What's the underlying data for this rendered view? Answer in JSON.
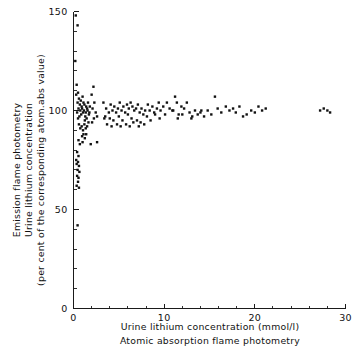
{
  "chart_data": {
    "type": "scatter",
    "title": "",
    "xlabel": "Urine lithium concentration (mmol/l)",
    "xlabel2": "Atomic absorption flame photometry",
    "ylabel": "Emission flame photometry",
    "ylabel2": "Urine lithium concentration",
    "ylabel3": "(per cent of the corresponding atom.abs value)",
    "xlim": [
      0,
      30
    ],
    "ylim": [
      0,
      150
    ],
    "xticks": [
      0,
      10,
      20,
      30
    ],
    "xticklabels": [
      "0",
      "10",
      "20",
      "30"
    ],
    "yticks": [
      0,
      50,
      100,
      150
    ],
    "yticklabels": [
      "0",
      "50",
      "100",
      "150"
    ],
    "x_minor_step": 2,
    "y_minor_step": 10,
    "grid": false,
    "legend": null,
    "marker": "filled-square",
    "marker_color": "#111111",
    "marker_size_px": 2.4,
    "points": [
      [
        0.25,
        148
      ],
      [
        0.45,
        143
      ],
      [
        0.2,
        125
      ],
      [
        0.35,
        113
      ],
      [
        0.3,
        108
      ],
      [
        0.5,
        109
      ],
      [
        0.6,
        106
      ],
      [
        0.45,
        104
      ],
      [
        0.7,
        103
      ],
      [
        0.55,
        101
      ],
      [
        0.4,
        99
      ],
      [
        0.65,
        97
      ],
      [
        0.5,
        96
      ],
      [
        0.8,
        105
      ],
      [
        0.9,
        102
      ],
      [
        0.75,
        100
      ],
      [
        0.85,
        98
      ],
      [
        1.0,
        107
      ],
      [
        1.1,
        104
      ],
      [
        0.95,
        101
      ],
      [
        1.05,
        99
      ],
      [
        1.2,
        103
      ],
      [
        1.15,
        100
      ],
      [
        1.3,
        97
      ],
      [
        1.25,
        95
      ],
      [
        1.4,
        102
      ],
      [
        1.35,
        99
      ],
      [
        1.5,
        101
      ],
      [
        1.45,
        96
      ],
      [
        1.6,
        104
      ],
      [
        1.55,
        100
      ],
      [
        1.7,
        98
      ],
      [
        1.65,
        94
      ],
      [
        1.8,
        102
      ],
      [
        1.75,
        99
      ],
      [
        0.6,
        93
      ],
      [
        0.75,
        91
      ],
      [
        0.9,
        92
      ],
      [
        1.05,
        90
      ],
      [
        1.2,
        93
      ],
      [
        1.35,
        91
      ],
      [
        1.5,
        92
      ],
      [
        1.1,
        88
      ],
      [
        0.95,
        87
      ],
      [
        1.25,
        86
      ],
      [
        1.4,
        88
      ],
      [
        0.55,
        85
      ],
      [
        0.7,
        83
      ],
      [
        1.0,
        84
      ],
      [
        2.2,
        112
      ],
      [
        2.0,
        108
      ],
      [
        2.3,
        104
      ],
      [
        2.1,
        101
      ],
      [
        2.45,
        99
      ],
      [
        2.25,
        96
      ],
      [
        2.6,
        97
      ],
      [
        2.05,
        94
      ],
      [
        0.4,
        79
      ],
      [
        0.55,
        77
      ],
      [
        0.3,
        75
      ],
      [
        0.5,
        74
      ],
      [
        0.35,
        73
      ],
      [
        0.6,
        72
      ],
      [
        0.45,
        70
      ],
      [
        0.65,
        69
      ],
      [
        0.4,
        67
      ],
      [
        0.55,
        66
      ],
      [
        0.5,
        64
      ],
      [
        0.35,
        62
      ],
      [
        0.6,
        61
      ],
      [
        0.45,
        42
      ],
      [
        1.9,
        83
      ],
      [
        2.6,
        84
      ],
      [
        3.3,
        104
      ],
      [
        3.6,
        101
      ],
      [
        3.9,
        99
      ],
      [
        3.5,
        97
      ],
      [
        4.1,
        103
      ],
      [
        4.3,
        100
      ],
      [
        4.0,
        96
      ],
      [
        4.5,
        102
      ],
      [
        4.7,
        99
      ],
      [
        4.4,
        95
      ],
      [
        4.9,
        101
      ],
      [
        5.1,
        104
      ],
      [
        5.3,
        100
      ],
      [
        5.0,
        97
      ],
      [
        5.5,
        102
      ],
      [
        5.7,
        99
      ],
      [
        5.4,
        95
      ],
      [
        5.9,
        103
      ],
      [
        6.1,
        101
      ],
      [
        6.3,
        104
      ],
      [
        6.0,
        98
      ],
      [
        6.5,
        102
      ],
      [
        6.7,
        100
      ],
      [
        6.4,
        96
      ],
      [
        6.9,
        101
      ],
      [
        7.1,
        103
      ],
      [
        7.3,
        99
      ],
      [
        7.0,
        95
      ],
      [
        7.5,
        101
      ],
      [
        7.7,
        98
      ],
      [
        7.4,
        94
      ],
      [
        7.9,
        100
      ],
      [
        3.7,
        93
      ],
      [
        4.2,
        92
      ],
      [
        4.8,
        93
      ],
      [
        5.2,
        92
      ],
      [
        5.8,
        93
      ],
      [
        6.2,
        92
      ],
      [
        6.6,
        94
      ],
      [
        7.2,
        92
      ],
      [
        7.8,
        93
      ],
      [
        3.4,
        96
      ],
      [
        8.2,
        103
      ],
      [
        8.4,
        100
      ],
      [
        8.1,
        97
      ],
      [
        8.7,
        102
      ],
      [
        8.9,
        99
      ],
      [
        8.5,
        95
      ],
      [
        9.2,
        101
      ],
      [
        9.4,
        104
      ],
      [
        9.0,
        98
      ],
      [
        9.6,
        100
      ],
      [
        9.9,
        102
      ],
      [
        9.5,
        96
      ],
      [
        10.3,
        104
      ],
      [
        10.6,
        101
      ],
      [
        10.1,
        98
      ],
      [
        10.9,
        100
      ],
      [
        11.2,
        107
      ],
      [
        11.4,
        104
      ],
      [
        11.0,
        100
      ],
      [
        11.6,
        98
      ],
      [
        11.9,
        102
      ],
      [
        11.5,
        96
      ],
      [
        12.2,
        101
      ],
      [
        12.5,
        104
      ],
      [
        12.0,
        98
      ],
      [
        12.8,
        99
      ],
      [
        13.1,
        97
      ],
      [
        13.4,
        100
      ],
      [
        13.0,
        96
      ],
      [
        13.7,
        98
      ],
      [
        14.1,
        100
      ],
      [
        14.4,
        97
      ],
      [
        14.0,
        99
      ],
      [
        14.8,
        100
      ],
      [
        15.2,
        98
      ],
      [
        15.6,
        107
      ],
      [
        15.9,
        101
      ],
      [
        16.3,
        99
      ],
      [
        16.8,
        102
      ],
      [
        17.2,
        100
      ],
      [
        17.6,
        101
      ],
      [
        17.9,
        99
      ],
      [
        18.3,
        102
      ],
      [
        18.7,
        97
      ],
      [
        19.1,
        98
      ],
      [
        19.6,
        100
      ],
      [
        20.0,
        99
      ],
      [
        20.4,
        102
      ],
      [
        20.8,
        100
      ],
      [
        21.2,
        101
      ],
      [
        27.2,
        100
      ],
      [
        27.6,
        101
      ],
      [
        28.0,
        100
      ],
      [
        28.3,
        99
      ]
    ]
  },
  "axes": {
    "x_axis_name": "x-axis",
    "y_axis_name": "y-axis"
  }
}
